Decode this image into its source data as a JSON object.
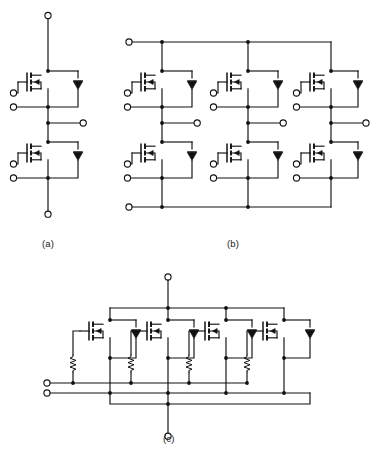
{
  "figure": {
    "background_color": "#ffffff",
    "line_color": "#111111",
    "subfigures": [
      {
        "id": "a",
        "caption": "(a)",
        "topology": "half-bridge (two-switch phase leg)",
        "mosfet_count": 2,
        "diode_count": 2,
        "resistor_count": 0,
        "terminals": [
          {
            "name": "drain-positive-terminal",
            "label": ""
          },
          {
            "name": "phase-output-terminal",
            "label": ""
          },
          {
            "name": "source-negative-terminal",
            "label": ""
          },
          {
            "name": "upper-gate-terminal",
            "label": ""
          },
          {
            "name": "upper-source-sense-terminal",
            "label": ""
          },
          {
            "name": "lower-gate-terminal",
            "label": ""
          },
          {
            "name": "lower-source-sense-terminal",
            "label": ""
          }
        ]
      },
      {
        "id": "b",
        "caption": "(b)",
        "topology": "three-phase bridge (six-pack)",
        "mosfet_count": 6,
        "diode_count": 6,
        "resistor_count": 0,
        "terminals": [
          {
            "name": "dc-positive-rail-terminal",
            "label": ""
          },
          {
            "name": "dc-negative-rail-terminal",
            "label": ""
          },
          {
            "name": "phase-u-output-terminal",
            "label": ""
          },
          {
            "name": "phase-v-output-terminal",
            "label": ""
          },
          {
            "name": "phase-w-output-terminal",
            "label": ""
          }
        ]
      },
      {
        "id": "c",
        "caption": "(c)",
        "topology": "four paralleled switches with gate resistors",
        "mosfet_count": 4,
        "diode_count": 4,
        "resistor_count": 4,
        "terminals": [
          {
            "name": "drain-top-terminal",
            "label": ""
          },
          {
            "name": "source-bottom-terminal",
            "label": ""
          },
          {
            "name": "gate-bus-terminal",
            "label": ""
          },
          {
            "name": "source-sense-bus-terminal",
            "label": ""
          }
        ]
      }
    ],
    "symbols": {
      "mosfet": "n-channel-mosfet-symbol",
      "diode": "antiparallel-body-diode-symbol",
      "resistor": "gate-resistor-symbol",
      "node": "junction-dot",
      "terminal": "open-circle-terminal"
    }
  }
}
